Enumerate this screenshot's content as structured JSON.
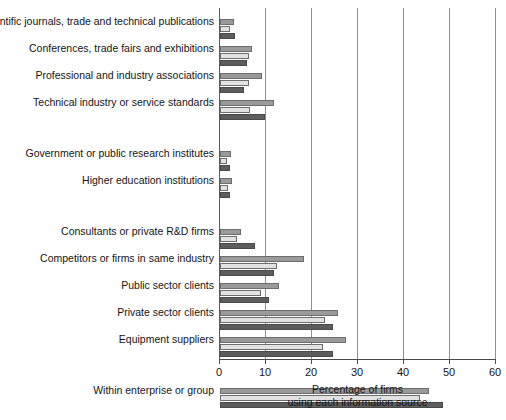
{
  "chart_data": {
    "type": "bar",
    "orientation": "horizontal",
    "title": "",
    "subtitle": "",
    "xlabel": "Percentage of firms using each information source",
    "xlabel_line1": "Percentage of firms",
    "xlabel_line2": "using each information source",
    "ylabel": "",
    "xlim": [
      0,
      60
    ],
    "xticks": [
      0,
      10,
      20,
      30,
      40,
      50,
      60
    ],
    "xtick_labels": [
      "0",
      "10",
      "20",
      "30",
      "40",
      "50",
      "60"
    ],
    "grid": "vertical",
    "legend": "none",
    "categories": [
      "Scientific journals, trade and technical publications",
      "Conferences, trade fairs and exhibitions",
      "Professional and industry associations",
      "Technical industry or service standards",
      "Government or public research institutes",
      "Higher education institutions",
      "Consultants or private R&D firms",
      "Competitors or firms in same industry",
      "Public sector clients",
      "Private sector clients",
      "Equipment suppliers",
      "Within enterprise or group"
    ],
    "series": [
      {
        "name": "series-1",
        "color": "#9a9a9a",
        "values": [
          3.0,
          6.9,
          9.2,
          11.8,
          2.4,
          2.6,
          4.6,
          18.3,
          12.8,
          25.7,
          27.4,
          45.4
        ]
      },
      {
        "name": "series-2",
        "color": "#e2e2e2",
        "values": [
          2.2,
          6.4,
          6.4,
          6.6,
          1.6,
          1.8,
          3.6,
          12.4,
          8.9,
          22.8,
          22.4,
          43.5
        ]
      },
      {
        "name": "series-3",
        "color": "#5d5d5d",
        "values": [
          3.3,
          5.9,
          5.3,
          9.7,
          2.1,
          2.1,
          7.6,
          11.8,
          10.6,
          24.6,
          24.6,
          48.5
        ]
      }
    ],
    "group_gaps_after": [
      3,
      5,
      10
    ]
  }
}
